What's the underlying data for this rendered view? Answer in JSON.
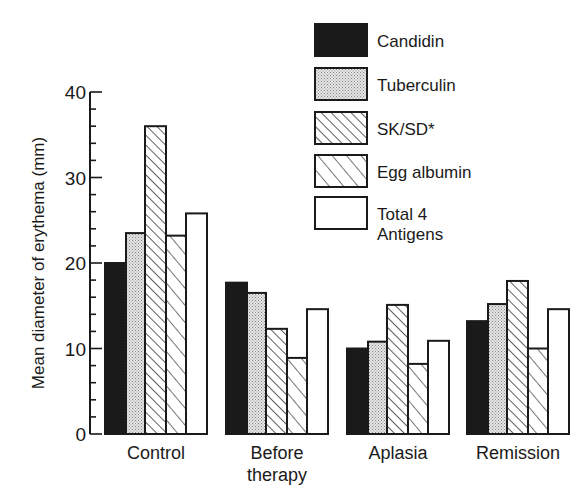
{
  "chart_data": {
    "type": "bar",
    "title": "",
    "xlabel": "",
    "ylabel": "Mean diameter of erythema (mm)",
    "ylim": [
      0,
      40
    ],
    "yticks_major": [
      0,
      10,
      20,
      30,
      40
    ],
    "ytick_minor_step": 2,
    "grid": false,
    "legend_position": "upper right",
    "categories": [
      "Control",
      "Before therapy",
      "Aplasia",
      "Remission"
    ],
    "category_label_lines": [
      [
        "Control"
      ],
      [
        "Before",
        "therapy"
      ],
      [
        "Aplasia"
      ],
      [
        "Remission"
      ]
    ],
    "series": [
      {
        "name": "Candidin",
        "pattern": "solid-black",
        "values": [
          20,
          17.7,
          10,
          13.2
        ]
      },
      {
        "name": "Tuberculin",
        "pattern": "stipple",
        "values": [
          23.5,
          16.5,
          10.8,
          15.2
        ]
      },
      {
        "name": "SK/SD*",
        "pattern": "dense-diagonal-hatch",
        "values": [
          36,
          12.3,
          15.1,
          17.9
        ]
      },
      {
        "name": "Egg albumin",
        "pattern": "sparse-diagonal-hatch",
        "values": [
          23.2,
          8.9,
          8.2,
          10
        ]
      },
      {
        "name": "Total 4 Antigens",
        "label_lines": [
          "Total 4",
          "Antigens"
        ],
        "pattern": "white",
        "values": [
          25.8,
          14.6,
          10.9,
          14.6
        ]
      }
    ]
  },
  "colors": {
    "ink": "#1a1a1a",
    "stipple": "#d9d9d9",
    "background": "#ffffff"
  }
}
